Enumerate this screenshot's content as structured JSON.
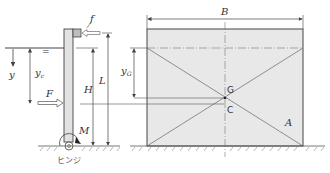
{
  "diagram": {
    "type": "engineering-schematic",
    "colors": {
      "line": "#444444",
      "fill": "#e6e6e6",
      "wall_fill": "#dcdcdc",
      "box_fill": "#b9b9b9"
    },
    "labels": {
      "f": "f",
      "y": "y",
      "yc": "y",
      "yc_sub": "c",
      "F": "F",
      "H": "H",
      "L": "L",
      "M": "M",
      "hinge": "ヒンジ",
      "B": "B",
      "yG": "y",
      "yG_sub": "G",
      "G": "G",
      "C": "C",
      "A": "A",
      "water_mark": "="
    }
  }
}
